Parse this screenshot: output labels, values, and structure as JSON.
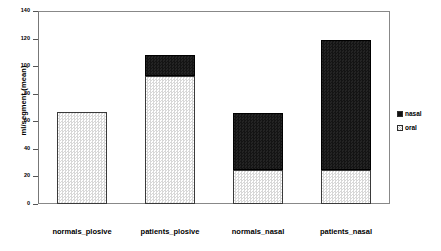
{
  "chart_data": {
    "type": "bar",
    "subtype": "stacked-bar",
    "title": "",
    "xlabel": "",
    "ylabel": "ml/segment (mean)",
    "ylim": [
      0,
      140
    ],
    "yticks": [
      0,
      20,
      40,
      60,
      80,
      100,
      120,
      140
    ],
    "ytick_labels": [
      "0",
      "20",
      "40",
      "60",
      "80",
      "100",
      "120",
      "140"
    ],
    "grid": false,
    "legend_position": "right",
    "categories": [
      "normals_plosive",
      "patients_plosive",
      "normals_nasal",
      "patients_nasal"
    ],
    "series": [
      {
        "name": "oral",
        "color": "#d8d8d8",
        "values": [
          67,
          93,
          25,
          25
        ]
      },
      {
        "name": "nasal",
        "color": "#111111",
        "values": [
          0,
          15,
          41,
          94
        ]
      }
    ],
    "totals": [
      67,
      108,
      66,
      119
    ]
  },
  "axis": {
    "y_title": "ml/segment (mean)"
  },
  "legend": {
    "entries": [
      {
        "label": "nasal",
        "swatch": "black-square-icon"
      },
      {
        "label": "oral",
        "swatch": "hatched-square-icon"
      }
    ]
  }
}
